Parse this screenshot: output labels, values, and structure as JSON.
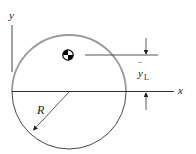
{
  "figure": {
    "type": "centroid-diagram",
    "labels": {
      "y_axis": "y",
      "x_axis": "x",
      "radius": "R",
      "centroid_distance": "y",
      "centroid_distance_bar": "‾",
      "centroid_distance_subscript": "L"
    },
    "colors": {
      "upper_arc": "#9a9a9a",
      "lower_arc": "#333333",
      "axis": "#333333",
      "centroid_marker": "#000000"
    },
    "geometry": {
      "circle_center": [
        69,
        92
      ],
      "radius_px": 57
    }
  }
}
